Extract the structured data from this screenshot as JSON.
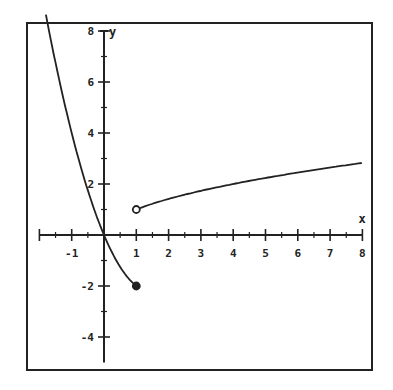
{
  "chart_data": {
    "type": "line",
    "title": "",
    "xlabel": "x",
    "ylabel": "y",
    "xlim": [
      -2,
      8
    ],
    "ylim": [
      -5,
      8
    ],
    "grid": false,
    "x_ticks": [
      -1,
      1,
      2,
      3,
      4,
      5,
      6,
      7,
      8
    ],
    "x_tick_labels": [
      "-1",
      "1",
      "2",
      "3",
      "4",
      "5",
      "6",
      "7",
      "8"
    ],
    "y_ticks": [
      8,
      6,
      4,
      2,
      -2,
      -4
    ],
    "y_tick_labels": [
      "8",
      "6",
      "4",
      "2",
      "-2",
      "-4"
    ],
    "series": [
      {
        "name": "left piece",
        "description": "y = x^2 - 3x for x <= 1",
        "x": [
          -1.8,
          -1.5,
          -1.2,
          -1,
          -0.8,
          -0.5,
          -0.2,
          0,
          0.2,
          0.5,
          0.8,
          1
        ],
        "y": [
          8.64,
          6.75,
          5.04,
          4,
          3.04,
          1.75,
          0.64,
          0,
          -0.56,
          -1.25,
          -1.76,
          -2
        ],
        "endpoint": {
          "x": 1,
          "y": -2,
          "style": "closed"
        }
      },
      {
        "name": "right piece",
        "description": "y = sqrt(x) for x > 1",
        "x": [
          1,
          1.5,
          2,
          3,
          4,
          5,
          6,
          7,
          8
        ],
        "y": [
          1,
          1.22,
          1.41,
          1.73,
          2,
          2.24,
          2.45,
          2.65,
          2.83
        ],
        "endpoint": {
          "x": 1,
          "y": 1,
          "style": "open"
        }
      }
    ]
  }
}
